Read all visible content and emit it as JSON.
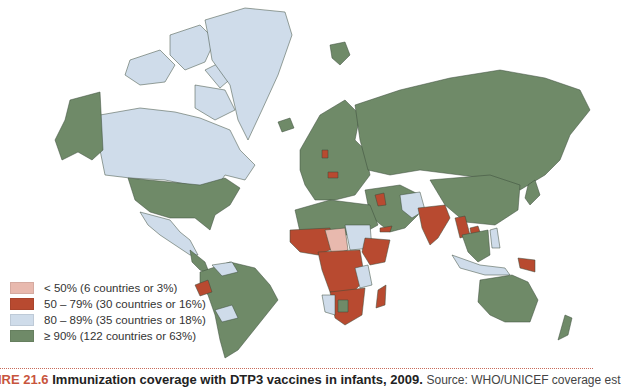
{
  "colors": {
    "lt50": "#e8b9ae",
    "r50_79": "#b84a30",
    "r80_89": "#cfdcea",
    "gte90": "#6f8a68",
    "background": "#ffffff"
  },
  "legend": {
    "items": [
      {
        "label": "< 50% (6 countries or 3%)",
        "color": "#e8b9ae"
      },
      {
        "label": "50 – 79% (30 countries or 16%)",
        "color": "#b84a30"
      },
      {
        "label": "80 – 89% (35 countries or 18%)",
        "color": "#cfdcea"
      },
      {
        "label": "≥ 90% (122 countries or 63%)",
        "color": "#6f8a68"
      }
    ]
  },
  "caption": {
    "figure_label": "IRE 21.6",
    "title": "Immunization coverage with DTP3 vaccines in infants, 2009.",
    "source": "Source: WHO/UNICEF coverage est"
  }
}
